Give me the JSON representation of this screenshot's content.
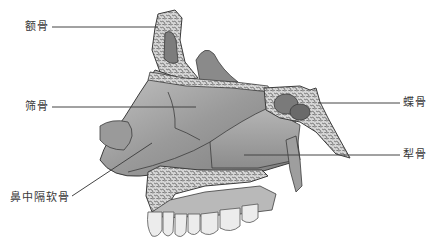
{
  "diagram": {
    "labels": [
      {
        "id": "frontal",
        "text": "额骨",
        "x": 25,
        "y": 21
      },
      {
        "id": "ethmoid",
        "text": "筛骨",
        "x": 25,
        "y": 101
      },
      {
        "id": "septal_cartilage",
        "text": "鼻中隔软骨",
        "x": 10,
        "y": 192
      },
      {
        "id": "sphenoid",
        "text": "蝶骨",
        "x": 403,
        "y": 97
      },
      {
        "id": "vomer",
        "text": "犁骨",
        "x": 403,
        "y": 149
      }
    ],
    "colors": {
      "bone_fill": "#a9a9a9",
      "bone_dark": "#6e6e6e",
      "spongy_fill": "#d2d2d2",
      "outline": "#3c3c3c",
      "leader_line": "#444444",
      "teeth": "#ececec"
    }
  }
}
